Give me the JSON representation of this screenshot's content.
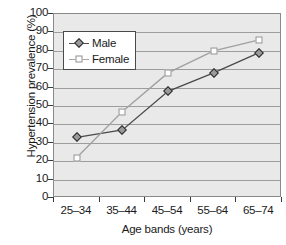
{
  "chart_data": {
    "type": "line",
    "title": "",
    "xlabel": "Age bands (years)",
    "ylabel": "Hypertension prevalence (%)",
    "categories": [
      "25–34",
      "35–44",
      "45–54",
      "55–64",
      "65–74"
    ],
    "series": [
      {
        "name": "Male",
        "values": [
          33,
          37,
          58,
          68,
          79
        ],
        "marker": "filled-diamond",
        "color": "#4a4a4a"
      },
      {
        "name": "Female",
        "values": [
          22,
          47,
          68,
          80,
          86
        ],
        "marker": "open-square",
        "color": "#a0a0a0"
      }
    ],
    "ylim": [
      0,
      100
    ],
    "yticks": [
      0,
      10,
      20,
      30,
      40,
      50,
      60,
      70,
      80,
      90,
      100
    ],
    "grid": true,
    "legend_position": "upper-left-inside",
    "plot_background": "#e9e9e9",
    "gridline_color": "#8f8f8f"
  },
  "legend": {
    "entries": [
      {
        "label": "Male",
        "icon": "filled-diamond-marker-icon"
      },
      {
        "label": "Female",
        "icon": "open-square-marker-icon"
      }
    ]
  }
}
